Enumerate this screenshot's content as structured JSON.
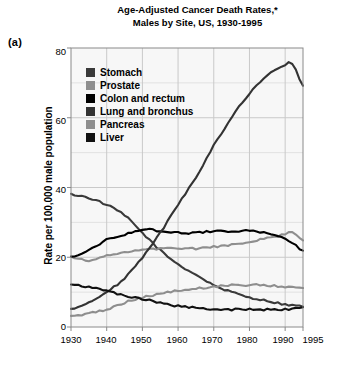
{
  "panel_label": "(a)",
  "title": {
    "line1": "Age-Adjusted Cancer Death Rates,*",
    "line2": "Males by Site, US, 1930-1995"
  },
  "axes": {
    "ylabel": "Rate per 100,000 male population",
    "yticks": [
      "0",
      "20",
      "40",
      "60",
      "80"
    ],
    "xticks": [
      "1930",
      "1940",
      "1950",
      "1960",
      "1970",
      "1980",
      "1990",
      "1995"
    ]
  },
  "colors": {
    "stomach": "#3a3a3a",
    "prostate": "#8e8e8e",
    "colon": "#000000",
    "lung": "#333333",
    "pancreas": "#8e8e8e",
    "liver": "#111111",
    "grid": "#c9c9c9",
    "axis": "#8a8a8a",
    "background": "#f7f7f7"
  },
  "chart_data": {
    "type": "line",
    "title": "Age-Adjusted Cancer Death Rates,* Males by Site, US, 1930-1995",
    "xlabel": "",
    "ylabel": "Rate per 100,000 male population",
    "xlim": [
      1930,
      1995
    ],
    "ylim": [
      0,
      80
    ],
    "grid": true,
    "legend_position": "upper-left-inside",
    "x": [
      1930,
      1935,
      1940,
      1945,
      1950,
      1955,
      1960,
      1965,
      1970,
      1975,
      1980,
      1985,
      1990,
      1992,
      1995
    ],
    "series": [
      {
        "name": "Stomach",
        "color": "#3a3a3a",
        "values": [
          38,
          37,
          35,
          32,
          27,
          22,
          18,
          15,
          12,
          10,
          8.5,
          7.5,
          6.5,
          6.2,
          6
        ]
      },
      {
        "name": "Prostate",
        "color": "#8e8e8e",
        "values": [
          20,
          19,
          20.5,
          21.5,
          22,
          22.5,
          22.5,
          22.5,
          23,
          23.5,
          24.5,
          25.5,
          26.5,
          27,
          25
        ]
      },
      {
        "name": "Colon and rectum",
        "color": "#000000",
        "values": [
          20,
          22,
          25,
          26.5,
          28,
          27.5,
          27,
          27,
          27.5,
          27.5,
          27.5,
          27,
          25.5,
          24,
          22
        ]
      },
      {
        "name": "Lung and bronchus",
        "color": "#333333",
        "values": [
          5,
          7,
          10,
          14,
          20,
          27,
          35,
          43,
          52,
          60,
          67,
          72,
          75,
          75.5,
          69
        ]
      },
      {
        "name": "Pancreas",
        "color": "#8e8e8e",
        "values": [
          3,
          4,
          5,
          7,
          8.5,
          9.5,
          10.5,
          11,
          11.5,
          12,
          12,
          12,
          11.5,
          11.5,
          11
        ]
      },
      {
        "name": "Liver",
        "color": "#111111",
        "values": [
          12,
          11.5,
          10.5,
          9,
          8,
          7,
          6,
          5.5,
          5,
          5,
          5,
          5,
          5,
          5.2,
          5.5
        ]
      }
    ]
  },
  "legend": {
    "items": [
      {
        "label": "Stomach",
        "color": "#3a3a3a"
      },
      {
        "label": "Prostate",
        "color": "#8e8e8e"
      },
      {
        "label": "Colon and rectum",
        "color": "#000000"
      },
      {
        "label": "Lung and bronchus",
        "color": "#333333"
      },
      {
        "label": "Pancreas",
        "color": "#8e8e8e"
      },
      {
        "label": "Liver",
        "color": "#111111"
      }
    ]
  }
}
